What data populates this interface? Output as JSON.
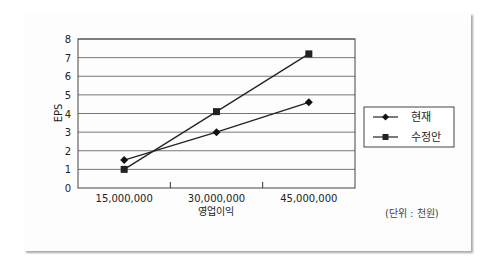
{
  "chart_data": {
    "type": "line",
    "title": "",
    "xlabel": "영업이익",
    "ylabel": "EPS",
    "categories": [
      "15,000,000",
      "30,000,000",
      "45,000,000"
    ],
    "x": [
      15000000,
      30000000,
      45000000
    ],
    "series": [
      {
        "name": "현재",
        "marker": "diamond",
        "values": [
          1.5,
          3.0,
          4.6
        ]
      },
      {
        "name": "수정안",
        "marker": "square",
        "values": [
          1.0,
          4.1,
          7.2
        ]
      }
    ],
    "ylim": [
      0,
      8
    ],
    "yticks": [
      "0",
      "1",
      "2",
      "3",
      "4",
      "5",
      "6",
      "7",
      "8"
    ],
    "grid": true,
    "legend_position": "right",
    "annotation": "(단위 : 천원)"
  },
  "colors": {
    "line": "#222222",
    "grid": "#777777",
    "card_bg": "#fdfdfd"
  }
}
